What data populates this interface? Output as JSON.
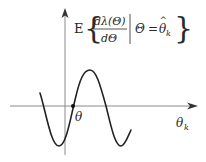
{
  "diagram": {
    "type": "function-sketch",
    "formula": {
      "expectation": "E",
      "numerator": "dλ(Θ)",
      "denominator": "dΘ",
      "condition_lhs": "Θ",
      "condition_eq": "=",
      "condition_rhs": "θ",
      "condition_rhs_hat": "^",
      "condition_rhs_sub": "k",
      "left_brace": "{",
      "right_brace": "}"
    },
    "labels": {
      "root": "θ",
      "x_axis": "θ",
      "x_axis_sub": "k"
    },
    "colors": {
      "axis": "#8a8a8a",
      "curve": "#222222",
      "text": "#2a2a2a"
    }
  }
}
